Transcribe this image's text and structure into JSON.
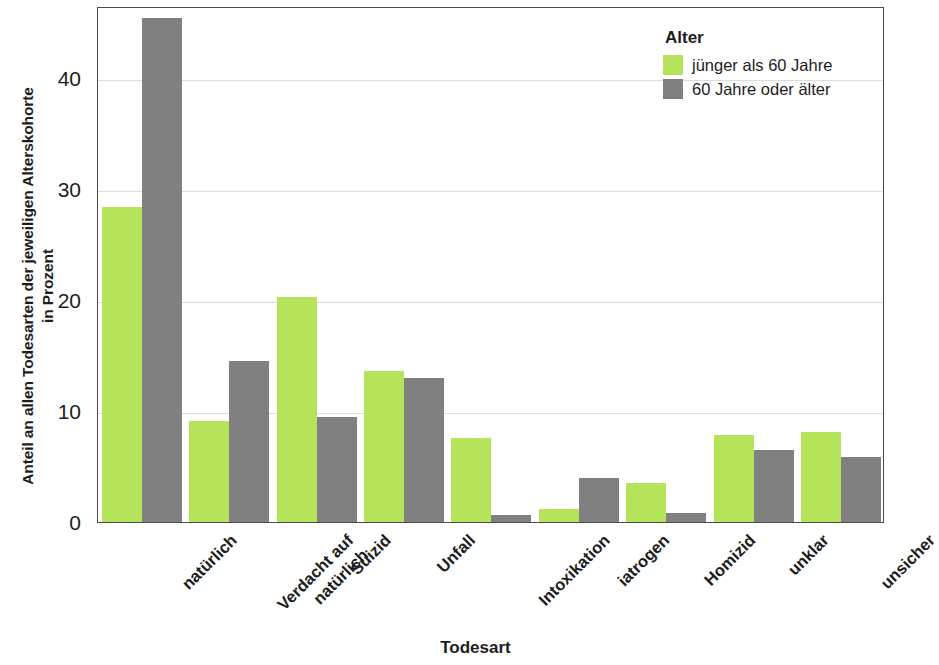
{
  "chart_data": {
    "type": "bar",
    "title": "",
    "xlabel": "Todesart",
    "ylabel_lines": [
      "Anteil an allen Todesarten der jeweiligen Alterskohorte",
      "in Prozent"
    ],
    "ylabel": "Anteil an allen Todesarten der jeweiligen Alterskohorte in Prozent",
    "categories": [
      "natürlich",
      "Verdacht auf\nnatürlich",
      "Suizid",
      "Unfall",
      "Intoxikation",
      "iatrogen",
      "Homizid",
      "unklar",
      "unsicher"
    ],
    "category_lines": [
      [
        "natürlich"
      ],
      [
        "Verdacht auf",
        "natürlich"
      ],
      [
        "Suizid"
      ],
      [
        "Unfall"
      ],
      [
        "Intoxikation"
      ],
      [
        "iatrogen"
      ],
      [
        "Homizid"
      ],
      [
        "unklar"
      ],
      [
        "unsicher"
      ]
    ],
    "series": [
      {
        "name": "jünger als 60 Jahre",
        "color": "#b5e35a",
        "values": [
          28.4,
          9.1,
          20.3,
          13.6,
          7.6,
          1.2,
          3.5,
          7.8,
          8.1
        ]
      },
      {
        "name": "60 Jahre oder älter",
        "color": "#808080",
        "values": [
          45.4,
          14.5,
          9.5,
          13.0,
          0.6,
          4.0,
          0.8,
          6.5,
          5.9
        ]
      }
    ],
    "ylim": [
      0,
      46.5
    ],
    "yticks": [
      0,
      10,
      20,
      30,
      40
    ],
    "ytick_labels": [
      "0",
      "10",
      "20",
      "30",
      "40"
    ],
    "grid": true,
    "legend_position": "top-right"
  },
  "legend": {
    "title": "Alter",
    "entries": [
      {
        "label": "jünger als 60 Jahre",
        "color": "#b5e35a"
      },
      {
        "label": "60 Jahre oder älter",
        "color": "#808080"
      }
    ]
  }
}
